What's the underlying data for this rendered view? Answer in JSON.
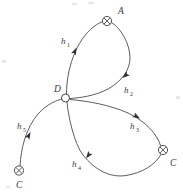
{
  "figure": {
    "kind": "path-diagram",
    "background_color": "#ffffff",
    "stroke_color": "#4a4a50",
    "label_color": "#3a3a40"
  },
  "nodes": [
    {
      "id": "A",
      "label": "A",
      "glyph": "crossed-circle",
      "x": 107,
      "y": 21,
      "r": 4.6,
      "label_x": 118,
      "label_y": 14
    },
    {
      "id": "D",
      "label": "D",
      "glyph": "open-circle",
      "x": 65.5,
      "y": 98,
      "r": 4.0,
      "label_x": 54,
      "label_y": 92
    },
    {
      "id": "C_right",
      "label": "C",
      "glyph": "crossed-circle",
      "x": 163,
      "y": 150,
      "r": 4.6,
      "label_x": 170,
      "label_y": 166
    },
    {
      "id": "C_left",
      "label": "C",
      "glyph": "crossed-circle",
      "x": 19,
      "y": 170.5,
      "r": 4.6,
      "label_x": 16,
      "label_y": 188
    }
  ],
  "edges": [
    {
      "id": "h1",
      "label_main": "h",
      "label_sub": "1",
      "from": "D",
      "to": "A",
      "path": "M 66.5,95.5 C 66,70 76,40 94,26.5 C 97.5,23.8 100.5,22.4 103,21.5",
      "label_x": 61,
      "label_y": 44,
      "arrow_x": 76.5,
      "arrow_y": 47.5,
      "arrow_angle": -66
    },
    {
      "id": "h2",
      "label_main": "h",
      "label_sub": "2",
      "from": "A",
      "to": "D",
      "path": "M 111.5,22.5 C 122,29 130,45 130,58 C 130,70 122,81 108,89 C 95,96 79,98 70,98.5",
      "label_x": 124,
      "label_y": 93,
      "arrow_x": 122.5,
      "arrow_y": 78,
      "arrow_angle": 140
    },
    {
      "id": "h3",
      "label_main": "h",
      "label_sub": "3",
      "from": "D",
      "to": "C_right",
      "path": "M 70,99.5 C 88,101 110,105 128,113 C 146,121.5 157,134 160.5,145.5",
      "label_x": 130,
      "label_y": 129,
      "arrow_x": 140,
      "arrow_y": 118.5,
      "arrow_angle": 30
    },
    {
      "id": "h4",
      "label_main": "h",
      "label_sub": "4",
      "from": "C_right",
      "to": "D",
      "path": "M 161,154.5 C 155,165 142,173 126,175.5 C 110,178 95,170 83,155 C 74,143.5 68,115 67,102",
      "label_x": 72,
      "label_y": 167,
      "arrow_x": 86,
      "arrow_y": 158.5,
      "arrow_angle": 126
    },
    {
      "id": "h5",
      "label_main": "h",
      "label_sub": "5",
      "from": "C_left",
      "to": "D",
      "path": "M 20,166 C 21,148 26,128 38,114 C 47,104 57,100 62,99",
      "label_x": 17,
      "label_y": 129,
      "arrow_x": 30.5,
      "arrow_y": 132,
      "arrow_angle": -63
    }
  ]
}
